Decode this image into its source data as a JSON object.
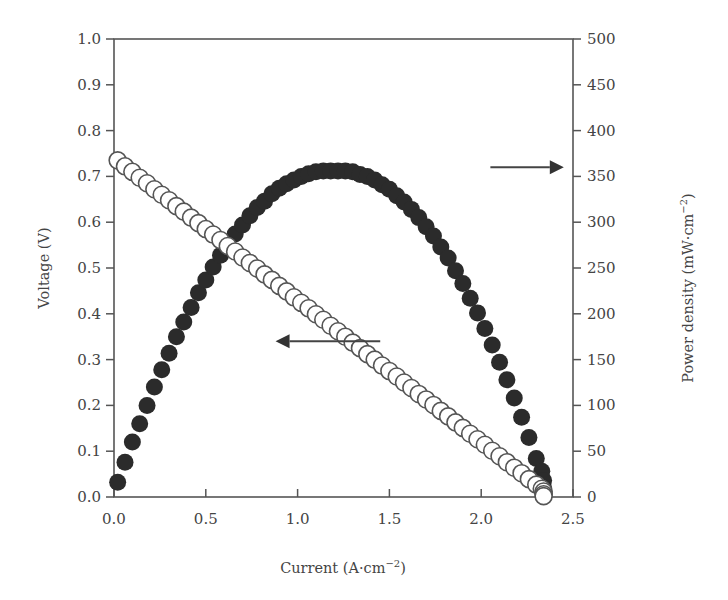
{
  "chart_data": {
    "type": "scatter",
    "title": "",
    "xlabel": "Current (A·cm⁻²)",
    "ylabel": "Voltage (V)",
    "y2label": "Power density (mW·cm⁻²)",
    "xlim": [
      0.0,
      2.5
    ],
    "ylim": [
      0.0,
      1.0
    ],
    "y2lim": [
      0,
      500
    ],
    "xticks": [
      "0.0",
      "0.5",
      "1.0",
      "1.5",
      "2.0",
      "2.5"
    ],
    "yticks": [
      "0.0",
      "0.1",
      "0.2",
      "0.3",
      "0.4",
      "0.5",
      "0.6",
      "0.7",
      "0.8",
      "0.9",
      "1.0"
    ],
    "y2ticks": [
      "0",
      "50",
      "100",
      "150",
      "200",
      "250",
      "300",
      "350",
      "400",
      "450",
      "500"
    ],
    "grid": false,
    "legend": "none (arrows indicate axis for each series)",
    "annotations": [
      {
        "type": "arrow",
        "direction": "left",
        "points_to": "Voltage (V) axis",
        "x_from": 1.45,
        "x_to": 0.88,
        "y": 0.34
      },
      {
        "type": "arrow",
        "direction": "right",
        "points_to": "Power density axis",
        "x_from": 2.05,
        "x_to": 2.45,
        "y": 0.72
      }
    ],
    "series": [
      {
        "name": "Voltage",
        "axis": "left",
        "marker": "open-circle",
        "color": "#555555",
        "x": [
          0.02,
          0.06,
          0.1,
          0.14,
          0.18,
          0.22,
          0.26,
          0.3,
          0.34,
          0.38,
          0.42,
          0.46,
          0.5,
          0.54,
          0.58,
          0.62,
          0.66,
          0.7,
          0.74,
          0.78,
          0.82,
          0.86,
          0.9,
          0.94,
          0.98,
          1.02,
          1.06,
          1.1,
          1.14,
          1.18,
          1.22,
          1.26,
          1.3,
          1.34,
          1.38,
          1.42,
          1.46,
          1.5,
          1.54,
          1.58,
          1.62,
          1.66,
          1.7,
          1.74,
          1.78,
          1.82,
          1.86,
          1.9,
          1.94,
          1.98,
          2.02,
          2.06,
          2.1,
          2.14,
          2.18,
          2.22,
          2.26,
          2.3,
          2.33,
          2.34,
          2.34,
          2.34
        ],
        "values": [
          0.735,
          0.722,
          0.71,
          0.697,
          0.685,
          0.672,
          0.66,
          0.648,
          0.635,
          0.623,
          0.61,
          0.598,
          0.585,
          0.573,
          0.561,
          0.548,
          0.536,
          0.523,
          0.511,
          0.499,
          0.486,
          0.474,
          0.461,
          0.449,
          0.436,
          0.424,
          0.412,
          0.399,
          0.387,
          0.374,
          0.362,
          0.35,
          0.337,
          0.325,
          0.312,
          0.3,
          0.287,
          0.275,
          0.263,
          0.25,
          0.238,
          0.225,
          0.213,
          0.201,
          0.188,
          0.176,
          0.163,
          0.151,
          0.138,
          0.126,
          0.114,
          0.101,
          0.089,
          0.076,
          0.064,
          0.052,
          0.039,
          0.027,
          0.018,
          0.012,
          0.006,
          0.002
        ]
      },
      {
        "name": "Power density",
        "axis": "right",
        "marker": "filled-circle",
        "color": "#2b2b2b",
        "x": [
          0.02,
          0.06,
          0.1,
          0.14,
          0.18,
          0.22,
          0.26,
          0.3,
          0.34,
          0.38,
          0.42,
          0.46,
          0.5,
          0.54,
          0.58,
          0.62,
          0.66,
          0.7,
          0.74,
          0.78,
          0.82,
          0.86,
          0.9,
          0.94,
          0.98,
          1.02,
          1.06,
          1.1,
          1.14,
          1.18,
          1.22,
          1.26,
          1.3,
          1.34,
          1.38,
          1.42,
          1.46,
          1.5,
          1.54,
          1.58,
          1.62,
          1.66,
          1.7,
          1.74,
          1.78,
          1.82,
          1.86,
          1.9,
          1.94,
          1.98,
          2.02,
          2.06,
          2.1,
          2.14,
          2.18,
          2.22,
          2.26,
          2.3,
          2.33,
          2.34,
          2.34,
          2.34
        ],
        "values": [
          16,
          38,
          60,
          80,
          100,
          120,
          139,
          157,
          175,
          191,
          207,
          223,
          237,
          251,
          264,
          276,
          287,
          297,
          307,
          316,
          323,
          331,
          337,
          342,
          346,
          350,
          353,
          355,
          356,
          356,
          356,
          356,
          355,
          352,
          350,
          346,
          341,
          336,
          329,
          322,
          314,
          305,
          295,
          285,
          273,
          261,
          247,
          233,
          217,
          201,
          184,
          166,
          147,
          128,
          108,
          87,
          65,
          42,
          28,
          18,
          10,
          4
        ]
      }
    ]
  },
  "plot": {
    "x_axis_title": "Current (A·cm",
    "x_axis_title_sup": "−2",
    "x_axis_title_end": ")",
    "y_axis_title": "Voltage (V)",
    "y2_axis_title": "Power density (mW·cm",
    "y2_axis_title_sup": "−2",
    "y2_axis_title_end": ")"
  }
}
